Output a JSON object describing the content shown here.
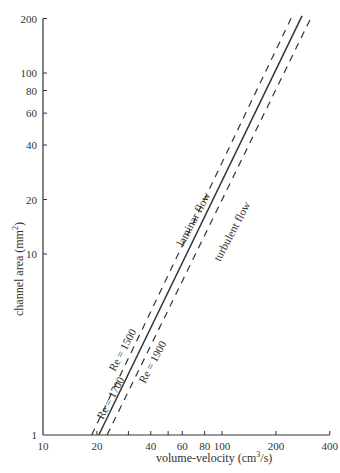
{
  "chart_data": {
    "type": "line",
    "title": "",
    "xlabel": "volume-velocity (cm³/s)",
    "ylabel": "channel area (mm²)",
    "xscale": "log",
    "yscale": "log",
    "xlim": [
      10,
      400
    ],
    "ylim": [
      1,
      200
    ],
    "grid": false,
    "x_ticks": [
      10,
      20,
      40,
      60,
      80,
      100,
      200,
      400
    ],
    "x_minor_ticks": [
      30,
      50
    ],
    "y_ticks": [
      1,
      10,
      20,
      40,
      60,
      80,
      100,
      200
    ],
    "series": [
      {
        "name": "Re = 1500",
        "style": "dashed",
        "points": [
          [
            18.7,
            1
          ],
          [
            247,
            207
          ]
        ]
      },
      {
        "name": "Re = 1700",
        "style": "solid",
        "points": [
          [
            20.5,
            1
          ],
          [
            280,
            207
          ]
        ]
      },
      {
        "name": "Re = 1900",
        "style": "dashed",
        "points": [
          [
            22.8,
            1
          ],
          [
            318,
            207
          ]
        ]
      }
    ],
    "annotations": [
      {
        "text": "laminar flow",
        "near": "upper-left of solid line"
      },
      {
        "text": "turbulent flow",
        "near": "lower-right of solid line"
      },
      {
        "text": "Re = 1500",
        "near": "left dashed line"
      },
      {
        "text": "Re = 1700",
        "near": "solid line"
      },
      {
        "text": "Re = 1900",
        "near": "right dashed line"
      }
    ]
  },
  "labels": {
    "xlabel": "volume-velocity (cm",
    "xlabel_sup": "3",
    "xlabel_tail": "/s)",
    "ylabel": "channel area (mm",
    "ylabel_sup": "2",
    "ylabel_tail": ")",
    "laminar": "laminar flow",
    "turbulent": "turbulent flow",
    "re1500": "Re = 1500",
    "re1700": "Re = 1700",
    "re1900": "Re = 1900"
  },
  "colors": {
    "ink": "#333333",
    "background": "#ffffff"
  }
}
